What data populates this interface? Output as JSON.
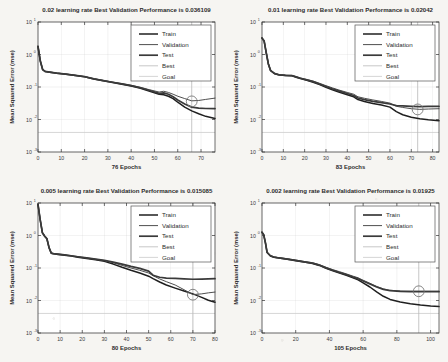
{
  "figure": {
    "kind": "matlab-training-performance-grid",
    "rows": 2,
    "cols": 2,
    "background": "#f6f5f2",
    "axis_color": "#333333",
    "grid_color": "#cfcfcf"
  },
  "legend": {
    "entries": [
      {
        "label": "Train",
        "color": "#1f1f1f",
        "width": 1.5
      },
      {
        "label": "Validation",
        "color": "#4f4f4f",
        "width": 1.0
      },
      {
        "label": "Test",
        "color": "#3a3a3a",
        "width": 1.7
      },
      {
        "label": "Best",
        "color": "#b9b9b9",
        "width": 0.8
      },
      {
        "label": "Goal",
        "color": "#cccccc",
        "width": 0.8
      }
    ]
  },
  "axes_common": {
    "ylabel": "Mean Squared Error  (mse)",
    "y_ticks": [
      "10",
      "10",
      "10",
      "10",
      "10"
    ],
    "y_exponents": [
      "1",
      "0",
      "-1",
      "-2",
      "-3"
    ],
    "ylim_log": [
      -3,
      1
    ],
    "grid": true,
    "best_marker": "circle"
  },
  "chart_data": [
    {
      "id": "panel-lr-0p02",
      "type": "line",
      "title": "0.02 learning rate Best Validation Performance is 0.036109",
      "learning_rate": 0.02,
      "best_validation_performance": 0.036109,
      "xlabel": "76 Epochs",
      "ylabel": "Mean Squared Error  (mse)",
      "epochs": 76,
      "xlim": [
        0,
        76
      ],
      "x_ticks": [
        0,
        10,
        20,
        30,
        40,
        50,
        60,
        70
      ],
      "ylim": [
        0.001,
        10
      ],
      "best_epoch": 66,
      "best_value": 0.036109,
      "goal": 0.0,
      "series": [
        {
          "name": "Train",
          "x": [
            0,
            1,
            2,
            3,
            5,
            8,
            12,
            16,
            20,
            24,
            28,
            32,
            36,
            40,
            44,
            48,
            52,
            54,
            56,
            58,
            60,
            63,
            66,
            69,
            72,
            76
          ],
          "y": [
            1.75,
            0.62,
            0.34,
            0.3,
            0.285,
            0.265,
            0.245,
            0.225,
            0.205,
            0.175,
            0.155,
            0.137,
            0.122,
            0.108,
            0.092,
            0.074,
            0.06,
            0.058,
            0.052,
            0.044,
            0.034,
            0.024,
            0.0185,
            0.015,
            0.0125,
            0.0108
          ]
        },
        {
          "name": "Validation",
          "x": [
            0,
            1,
            2,
            3,
            5,
            8,
            12,
            16,
            20,
            24,
            28,
            32,
            36,
            40,
            44,
            48,
            52,
            54,
            56,
            58,
            60,
            63,
            66,
            69,
            72,
            76
          ],
          "y": [
            1.8,
            0.64,
            0.35,
            0.305,
            0.29,
            0.27,
            0.25,
            0.23,
            0.21,
            0.18,
            0.16,
            0.142,
            0.127,
            0.113,
            0.098,
            0.082,
            0.07,
            0.074,
            0.068,
            0.06,
            0.052,
            0.044,
            0.0375,
            0.0385,
            0.0415,
            0.0455
          ]
        },
        {
          "name": "Test",
          "x": [
            0,
            1,
            2,
            3,
            5,
            8,
            12,
            16,
            20,
            24,
            28,
            32,
            36,
            40,
            44,
            48,
            52,
            54,
            56,
            58,
            60,
            63,
            66,
            69,
            72,
            76
          ],
          "y": [
            1.78,
            0.63,
            0.345,
            0.302,
            0.288,
            0.268,
            0.248,
            0.228,
            0.208,
            0.178,
            0.158,
            0.14,
            0.125,
            0.11,
            0.095,
            0.078,
            0.064,
            0.066,
            0.06,
            0.05,
            0.04,
            0.03,
            0.024,
            0.0225,
            0.0218,
            0.0215
          ]
        }
      ]
    },
    {
      "id": "panel-lr-0p01",
      "type": "line",
      "title": "0.01 learning rate Best Validation Performance is 0.02042",
      "learning_rate": 0.01,
      "best_validation_performance": 0.02042,
      "xlabel": "83 Epochs",
      "ylabel": "Mean Squared Error  (mse)",
      "epochs": 83,
      "xlim": [
        0,
        83
      ],
      "x_ticks": [
        0,
        10,
        20,
        30,
        40,
        50,
        60,
        70,
        80
      ],
      "ylim": [
        0.001,
        10
      ],
      "best_epoch": 73,
      "best_value": 0.02042,
      "goal": 0.0,
      "series": [
        {
          "name": "Train",
          "x": [
            0,
            1,
            2,
            3,
            4,
            6,
            8,
            11,
            14,
            16,
            18,
            21,
            24,
            27,
            30,
            33,
            36,
            40,
            43,
            45,
            48,
            52,
            56,
            60,
            63,
            66,
            70,
            74,
            78,
            83
          ],
          "y": [
            3.2,
            2.6,
            1.1,
            0.5,
            0.32,
            0.255,
            0.235,
            0.225,
            0.222,
            0.2,
            0.182,
            0.16,
            0.14,
            0.118,
            0.098,
            0.082,
            0.07,
            0.058,
            0.05,
            0.041,
            0.036,
            0.031,
            0.028,
            0.024,
            0.0175,
            0.014,
            0.0118,
            0.0105,
            0.0098,
            0.0092
          ]
        },
        {
          "name": "Validation",
          "x": [
            0,
            1,
            2,
            3,
            4,
            6,
            8,
            11,
            14,
            16,
            18,
            21,
            24,
            27,
            30,
            33,
            36,
            40,
            43,
            45,
            48,
            52,
            56,
            60,
            63,
            66,
            70,
            74,
            78,
            83
          ],
          "y": [
            3.25,
            2.65,
            1.13,
            0.52,
            0.33,
            0.262,
            0.242,
            0.232,
            0.228,
            0.208,
            0.19,
            0.17,
            0.152,
            0.13,
            0.11,
            0.094,
            0.081,
            0.068,
            0.06,
            0.05,
            0.045,
            0.04,
            0.036,
            0.032,
            0.0255,
            0.0235,
            0.0215,
            0.0205,
            0.021,
            0.0215
          ]
        },
        {
          "name": "Test",
          "x": [
            0,
            1,
            2,
            3,
            4,
            6,
            8,
            11,
            14,
            16,
            18,
            21,
            24,
            27,
            30,
            33,
            36,
            40,
            43,
            45,
            48,
            52,
            56,
            60,
            63,
            66,
            70,
            74,
            78,
            83
          ],
          "y": [
            3.22,
            2.62,
            1.12,
            0.51,
            0.325,
            0.258,
            0.238,
            0.228,
            0.225,
            0.205,
            0.186,
            0.165,
            0.146,
            0.124,
            0.104,
            0.088,
            0.076,
            0.063,
            0.055,
            0.046,
            0.041,
            0.036,
            0.033,
            0.03,
            0.0268,
            0.0262,
            0.0255,
            0.025,
            0.0252,
            0.0255
          ]
        }
      ]
    },
    {
      "id": "panel-lr-0p005",
      "type": "line",
      "title": "0.005 learning rate Best Validation Performance is 0.015085",
      "learning_rate": 0.005,
      "best_validation_performance": 0.015085,
      "xlabel": "80 Epochs",
      "ylabel": "Mean Squared Error  (mse)",
      "epochs": 80,
      "xlim": [
        0,
        80
      ],
      "x_ticks": [
        0,
        10,
        20,
        30,
        40,
        50,
        60,
        70,
        80
      ],
      "ylim": [
        0.001,
        10
      ],
      "best_epoch": 70,
      "best_value": 0.015085,
      "goal": 0.0,
      "series": [
        {
          "name": "Train",
          "x": [
            0,
            1,
            2,
            3,
            4,
            5,
            6,
            7,
            9,
            12,
            15,
            18,
            22,
            26,
            30,
            34,
            38,
            42,
            46,
            50,
            52,
            55,
            58,
            62,
            66,
            70,
            74,
            77,
            80
          ],
          "y": [
            9.0,
            3.0,
            1.2,
            0.95,
            0.8,
            0.42,
            0.285,
            0.272,
            0.262,
            0.248,
            0.232,
            0.215,
            0.196,
            0.178,
            0.16,
            0.132,
            0.105,
            0.085,
            0.07,
            0.056,
            0.047,
            0.037,
            0.03,
            0.024,
            0.0195,
            0.016,
            0.0125,
            0.0102,
            0.0088
          ]
        },
        {
          "name": "Validation",
          "x": [
            0,
            1,
            2,
            3,
            4,
            5,
            6,
            7,
            9,
            12,
            15,
            18,
            22,
            26,
            30,
            34,
            38,
            42,
            46,
            50,
            52,
            55,
            58,
            62,
            66,
            70,
            74,
            77,
            80
          ],
          "y": [
            9.1,
            3.05,
            1.22,
            0.97,
            0.82,
            0.43,
            0.292,
            0.28,
            0.27,
            0.256,
            0.24,
            0.224,
            0.205,
            0.187,
            0.17,
            0.145,
            0.12,
            0.1,
            0.085,
            0.07,
            0.058,
            0.046,
            0.038,
            0.03,
            0.0215,
            0.0152,
            0.016,
            0.0172,
            0.0182
          ]
        },
        {
          "name": "Test",
          "x": [
            0,
            1,
            2,
            3,
            4,
            5,
            6,
            7,
            9,
            12,
            15,
            18,
            22,
            26,
            30,
            34,
            38,
            42,
            46,
            50,
            52,
            55,
            58,
            62,
            66,
            70,
            74,
            77,
            80
          ],
          "y": [
            9.05,
            3.02,
            1.21,
            0.96,
            0.81,
            0.425,
            0.288,
            0.276,
            0.266,
            0.252,
            0.238,
            0.222,
            0.204,
            0.188,
            0.172,
            0.152,
            0.132,
            0.112,
            0.097,
            0.08,
            0.06,
            0.052,
            0.049,
            0.0478,
            0.0462,
            0.045,
            0.0455,
            0.0462,
            0.047
          ]
        }
      ]
    },
    {
      "id": "panel-lr-0p002",
      "type": "line",
      "title": "0.002 learning rate Best Validation Performance is 0.01925",
      "learning_rate": 0.002,
      "best_validation_performance": 0.01925,
      "xlabel": "105 Epochs",
      "ylabel": "Mean Squared Error  (mse)",
      "epochs": 105,
      "xlim": [
        0,
        105
      ],
      "x_ticks": [
        0,
        20,
        40,
        60,
        80,
        100
      ],
      "ylim": [
        0.001,
        10
      ],
      "best_epoch": 93,
      "best_value": 0.01925,
      "goal": 0.0,
      "series": [
        {
          "name": "Train",
          "x": [
            0,
            1,
            2,
            3,
            5,
            7,
            9,
            12,
            16,
            20,
            25,
            30,
            34,
            38,
            42,
            46,
            50,
            54,
            57,
            60,
            64,
            68,
            72,
            76,
            82,
            88,
            94,
            100,
            105
          ],
          "y": [
            1.25,
            1.05,
            0.6,
            0.3,
            0.235,
            0.215,
            0.205,
            0.196,
            0.182,
            0.168,
            0.152,
            0.138,
            0.12,
            0.098,
            0.082,
            0.07,
            0.06,
            0.05,
            0.043,
            0.035,
            0.026,
            0.0185,
            0.0135,
            0.0108,
            0.009,
            0.008,
            0.0073,
            0.0068,
            0.0065
          ]
        },
        {
          "name": "Validation",
          "x": [
            0,
            1,
            2,
            3,
            5,
            7,
            9,
            12,
            16,
            20,
            25,
            30,
            34,
            38,
            42,
            46,
            50,
            54,
            57,
            60,
            64,
            68,
            72,
            76,
            82,
            88,
            94,
            100,
            105
          ],
          "y": [
            1.28,
            1.07,
            0.62,
            0.31,
            0.242,
            0.222,
            0.212,
            0.203,
            0.189,
            0.175,
            0.159,
            0.145,
            0.127,
            0.105,
            0.089,
            0.077,
            0.066,
            0.056,
            0.05,
            0.042,
            0.034,
            0.0272,
            0.0228,
            0.0206,
            0.0196,
            0.0193,
            0.0192,
            0.0192,
            0.0192
          ]
        },
        {
          "name": "Test",
          "x": [
            0,
            1,
            2,
            3,
            5,
            7,
            9,
            12,
            16,
            20,
            25,
            30,
            34,
            38,
            42,
            46,
            50,
            54,
            57,
            60,
            64,
            68,
            72,
            76,
            82,
            88,
            94,
            100,
            105
          ],
          "y": [
            1.265,
            1.06,
            0.61,
            0.305,
            0.238,
            0.218,
            0.208,
            0.199,
            0.185,
            0.171,
            0.155,
            0.141,
            0.123,
            0.101,
            0.085,
            0.073,
            0.063,
            0.053,
            0.047,
            0.04,
            0.032,
            0.026,
            0.022,
            0.02,
            0.019,
            0.0188,
            0.0187,
            0.0187,
            0.0187
          ]
        }
      ]
    }
  ]
}
